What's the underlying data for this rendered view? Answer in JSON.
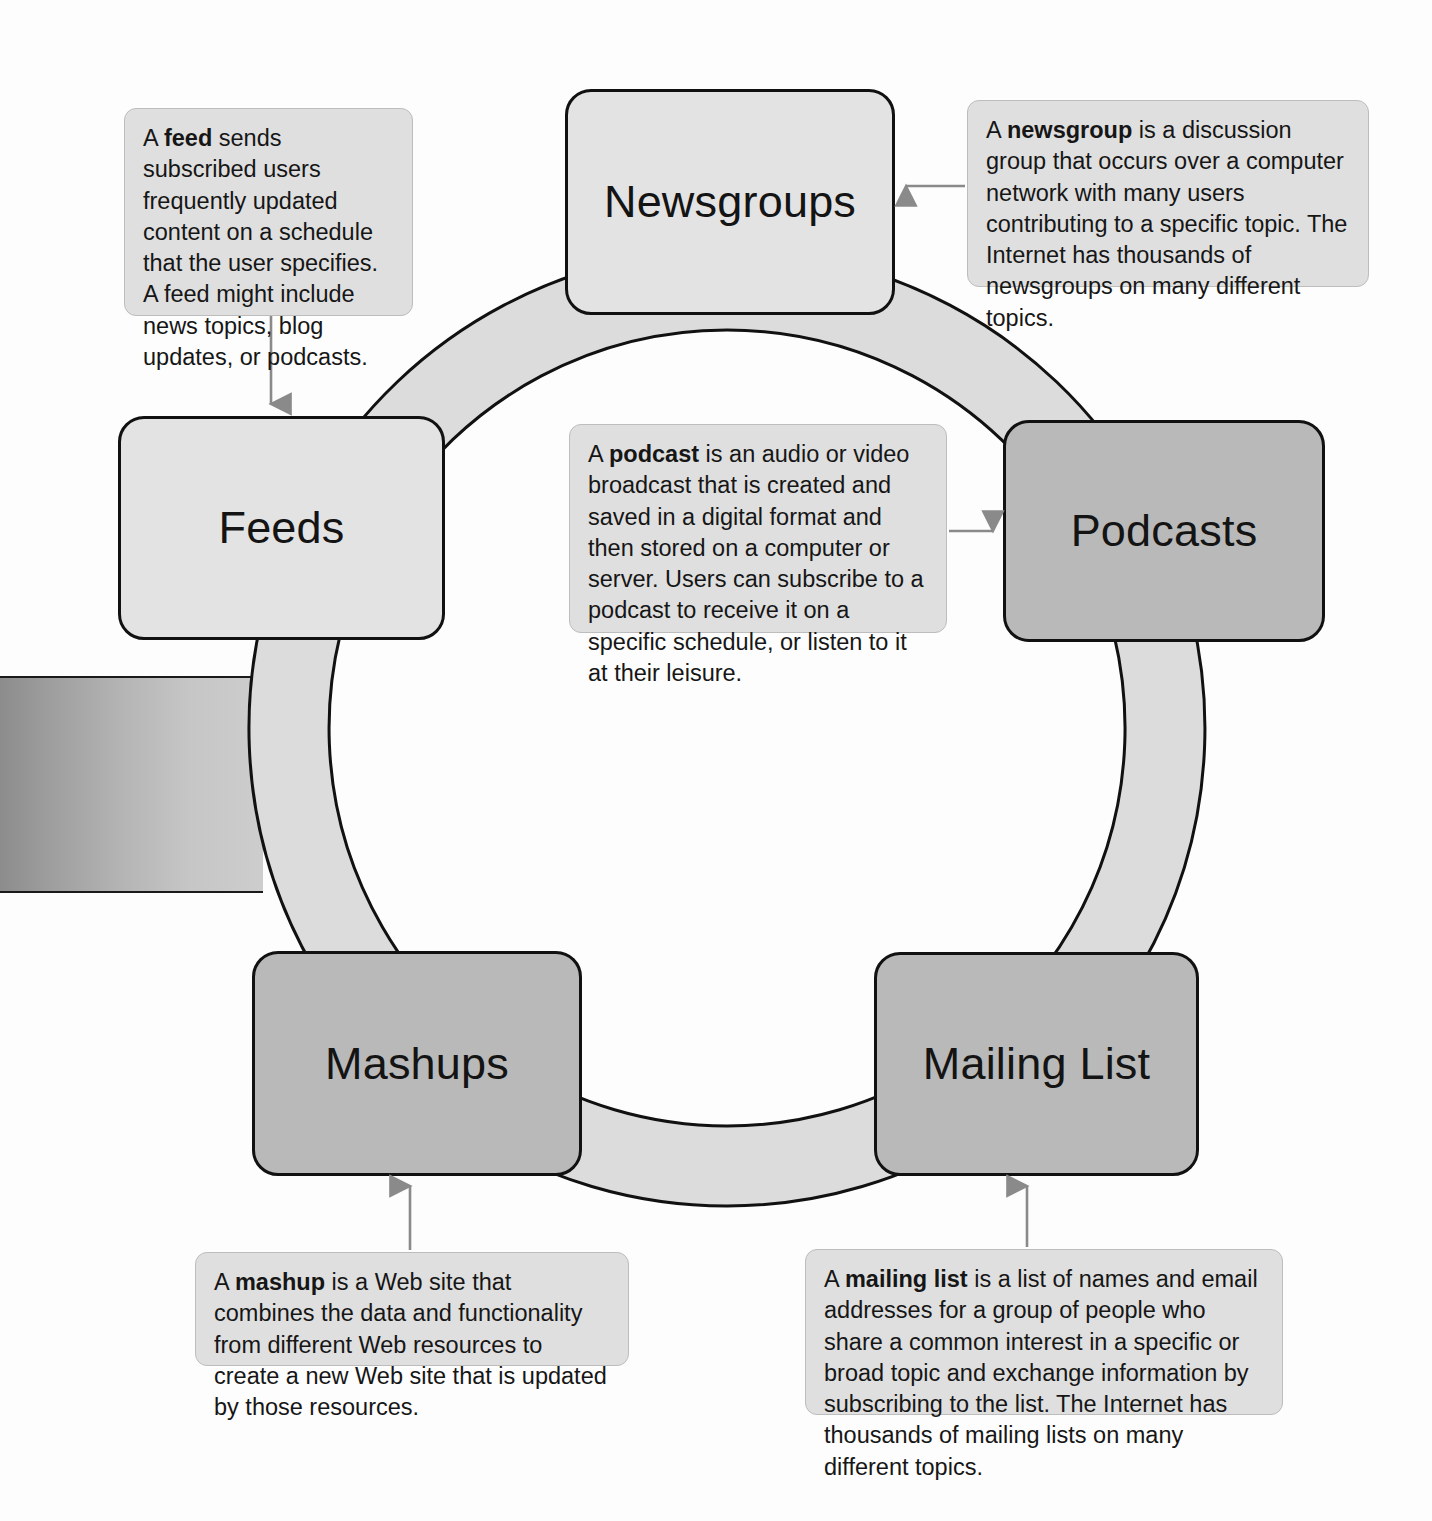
{
  "diagram": {
    "ring_color": "#dcdcdc",
    "ring_border_color": "#111111",
    "background_color": "#fdfdfd"
  },
  "nodes": [
    {
      "id": "newsgroups",
      "label": "Newsgroups",
      "fill": "#e3e3e3"
    },
    {
      "id": "podcasts",
      "label": "Podcasts",
      "fill": "#b9b9b9"
    },
    {
      "id": "feeds",
      "label": "Feeds",
      "fill": "#e3e3e3"
    },
    {
      "id": "mashups",
      "label": "Mashups",
      "fill": "#b9b9b9"
    },
    {
      "id": "mailing_list",
      "label": "Mailing List",
      "fill": "#b9b9b9"
    }
  ],
  "callouts": {
    "feed": {
      "term": "feed",
      "lead": "A ",
      "body": " sends subscribed users frequently updated content on a schedule that the user specifies. A feed might include news topics, blog updates, or podcasts."
    },
    "newsgroup": {
      "term": "newsgroup",
      "lead": "A ",
      "body": " is a discussion group that occurs over a computer network with many users contributing to a specific topic. The Internet has thousands of newsgroups on many different topics."
    },
    "podcast": {
      "term": "podcast",
      "lead": "A ",
      "body": " is an audio or video broadcast that is created and saved in a digital format and then stored on a computer or server. Users can subscribe to a podcast to receive it on a specific schedule, or listen to it at their leisure."
    },
    "mashup": {
      "term": "mashup",
      "lead": "A ",
      "body": " is a Web site that combines the data and functionality from different Web resources to create a new Web site that is updated by those resources."
    },
    "mailing_list": {
      "term": "mailing list",
      "lead": "A ",
      "body": " is a list of names and email addresses for a group of people who share a common interest in a specific or broad topic and exchange information by subscribing to the list. The Internet has thousands of mailing lists on many different topics."
    }
  },
  "arrows": {
    "color": "#8a8a8a",
    "items": [
      {
        "name": "arrow-feed-to-feeds",
        "direction": "down"
      },
      {
        "name": "arrow-newsgroup-to-newsgroups",
        "direction": "left"
      },
      {
        "name": "arrow-podcast-to-podcasts",
        "direction": "right"
      },
      {
        "name": "arrow-mashup-to-mashups",
        "direction": "up"
      },
      {
        "name": "arrow-mailinglist-to-mailinglist",
        "direction": "up"
      }
    ]
  }
}
